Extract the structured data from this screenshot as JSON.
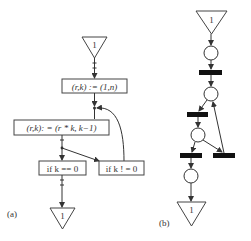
{
  "figure_a": {
    "caption": "(a)",
    "start_token": "1",
    "end_token": "1",
    "boxes": [
      {
        "id": "init",
        "label": "(r,k) := (1,n)"
      },
      {
        "id": "update",
        "label": "(r,k): = (r * k, k−1)"
      },
      {
        "id": "exit_cond",
        "label": "if k == 0"
      },
      {
        "id": "loop_cond",
        "label": "if k ! = 0"
      }
    ]
  },
  "figure_b": {
    "caption": "(b)",
    "start_token": "1",
    "end_token": "1",
    "places": 4,
    "transitions": 4
  },
  "colors": {
    "ink": "#333333",
    "bar": "#111111",
    "background": "#ffffff"
  }
}
